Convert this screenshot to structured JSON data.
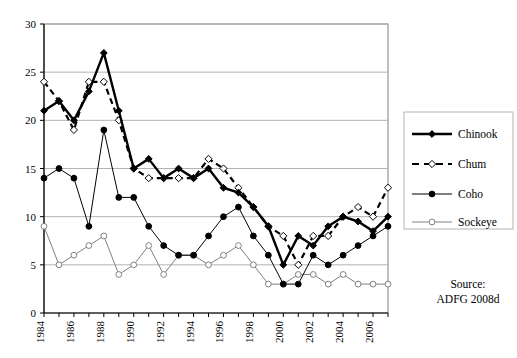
{
  "chart_data": {
    "type": "line",
    "title": "",
    "xlabel": "",
    "ylabel": "",
    "x": [
      1984,
      1985,
      1986,
      1987,
      1988,
      1989,
      1990,
      1991,
      1992,
      1993,
      1994,
      1995,
      1996,
      1997,
      1998,
      1999,
      2000,
      2001,
      2002,
      2003,
      2004,
      2005,
      2006,
      2007
    ],
    "xlim": [
      1984,
      2007
    ],
    "ylim": [
      0,
      30
    ],
    "yticks": [
      0,
      5,
      10,
      15,
      20,
      25,
      30
    ],
    "xticks": [
      1984,
      1985,
      1986,
      1987,
      1988,
      1989,
      1990,
      1991,
      1992,
      1993,
      1994,
      1995,
      1996,
      1997,
      1998,
      1999,
      2000,
      2001,
      2002,
      2003,
      2004,
      2005,
      2006,
      2007
    ],
    "xtick_labels_shown": [
      "1984",
      "1986",
      "1988",
      "1990",
      "1992",
      "1994",
      "1996",
      "1998",
      "2000",
      "2002",
      "2004",
      "2006"
    ],
    "grid": "horizontal",
    "legend_position": "right",
    "series": [
      {
        "name": "Chinook",
        "marker": "filled-diamond",
        "line": "solid-thick",
        "color": "#000000",
        "values": [
          21,
          22,
          20,
          23,
          27,
          21,
          15,
          16,
          14,
          15,
          14,
          15,
          13,
          12.5,
          11,
          9,
          5,
          8,
          7,
          9,
          10,
          9.5,
          8.5,
          10
        ]
      },
      {
        "name": "Chum",
        "marker": "open-diamond",
        "line": "dashed-thick",
        "color": "#000000",
        "values": [
          24,
          22,
          19,
          24,
          24,
          20,
          15,
          14,
          14,
          14,
          14,
          16,
          15,
          13,
          11,
          9,
          8,
          5,
          8,
          8,
          10,
          11,
          10,
          13
        ]
      },
      {
        "name": "Coho",
        "marker": "filled-circle",
        "line": "solid-thin",
        "color": "#000000",
        "values": [
          14,
          15,
          14,
          9,
          19,
          12,
          12,
          9,
          7,
          6,
          6,
          8,
          10,
          11,
          8,
          6,
          3,
          3,
          6,
          5,
          6,
          7,
          8,
          9
        ]
      },
      {
        "name": "Sockeye",
        "marker": "open-circle",
        "line": "solid-thin-gray",
        "color": "#808080",
        "values": [
          9,
          5,
          6,
          7,
          8,
          4,
          5,
          7,
          4,
          6,
          6,
          5,
          6,
          7,
          5,
          3,
          3,
          4,
          4,
          3,
          4,
          3,
          3,
          3
        ]
      }
    ]
  },
  "legend": {
    "items": [
      {
        "label": "Chinook"
      },
      {
        "label": "Chum"
      },
      {
        "label": "Coho"
      },
      {
        "label": "Sockeye"
      }
    ]
  },
  "source": {
    "line1": "Source:",
    "line2": "ADFG 2008d"
  }
}
